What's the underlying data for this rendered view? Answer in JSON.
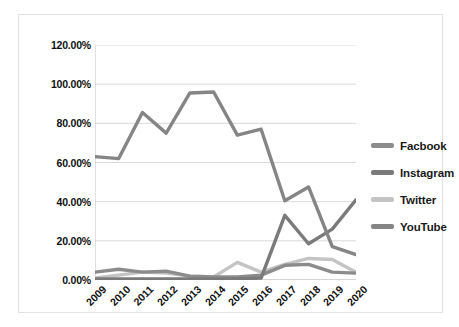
{
  "chart_data": {
    "type": "line",
    "title": "",
    "subtitle": "",
    "xlabel": "",
    "ylabel": "",
    "grid": true,
    "legend_position": "right",
    "ylim": [
      0,
      120
    ],
    "y_tick_labels": [
      "0.00%",
      "20.00%",
      "40.00%",
      "60.00%",
      "80.00%",
      "100.00%",
      "120.00%"
    ],
    "y_tick_values": [
      0,
      20,
      40,
      60,
      80,
      100,
      120
    ],
    "categories": [
      "2009",
      "2010",
      "2011",
      "2012",
      "2013",
      "2014",
      "2015",
      "2016",
      "2017",
      "2018",
      "2019",
      "2020"
    ],
    "x": [
      "2009",
      "2010",
      "2011",
      "2012",
      "2013",
      "2014",
      "2015",
      "2016",
      "2017",
      "2018",
      "2019",
      "2020"
    ],
    "series": [
      {
        "name": "Facbook",
        "color": "#8c8c8c",
        "values": [
          4.0,
          5.5,
          4.0,
          4.5,
          2.0,
          1.5,
          1.5,
          2.5,
          7.5,
          8.0,
          4.0,
          3.5
        ]
      },
      {
        "name": "Instagram",
        "color": "#7a7a7a",
        "values": [
          0.5,
          0.5,
          0.5,
          0.5,
          0.5,
          0.5,
          0.5,
          1.0,
          33.0,
          18.5,
          26.0,
          41.0
        ]
      },
      {
        "name": "Twitter",
        "color": "#c4c4c4",
        "values": [
          1.0,
          2.5,
          4.0,
          3.5,
          2.0,
          1.5,
          9.0,
          4.0,
          8.0,
          11.0,
          10.5,
          4.0
        ]
      },
      {
        "name": "YouTube",
        "color": "#858585",
        "values": [
          63.0,
          62.0,
          85.5,
          75.0,
          95.5,
          96.0,
          74.0,
          77.0,
          40.5,
          47.5,
          17.0,
          13.0
        ]
      }
    ]
  },
  "legend": {
    "items": [
      {
        "label": "Facbook",
        "color": "#8c8c8c"
      },
      {
        "label": "Instagram",
        "color": "#7a7a7a"
      },
      {
        "label": "Twitter",
        "color": "#c4c4c4"
      },
      {
        "label": "YouTube",
        "color": "#858585"
      }
    ]
  },
  "colors": {
    "plot_background": "#ffffff",
    "grid_line": "#d9d9d9",
    "axis_line": "#bfbfbf",
    "frame_border": "#e2e2e2",
    "text": "#111111"
  }
}
